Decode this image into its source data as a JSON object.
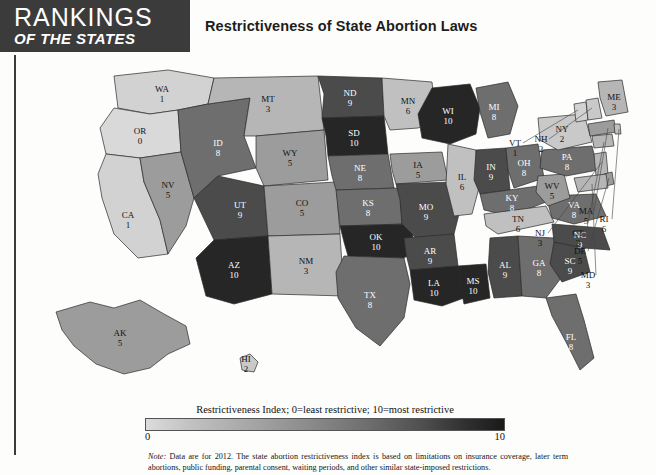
{
  "brand": {
    "line1": "RANKINGS",
    "line2": "OF THE STATES"
  },
  "title": "Restrictiveness of State Abortion Laws",
  "legend": {
    "caption": "Restrictiveness Index; 0=least restrictive; 10=most restrictive",
    "min": "0",
    "max": "10",
    "gradient_from": "#dcdcdc",
    "gradient_to": "#1a1a1a"
  },
  "note": {
    "label": "Note:",
    "line1": "Data are for 2012. The state abortion restrictiveness index is based on limitations on insurance coverage, later term",
    "line2": "abortions, public funding, parental consent, waiting periods, and other similar state-imposed restrictions."
  },
  "chart_data": {
    "type": "choropleth",
    "title": "Restrictiveness of State Abortion Laws",
    "value_name": "Restrictiveness Index",
    "vmin": 0,
    "vmax": 10,
    "colormap": "grayscale-light-to-dark",
    "year": "2012",
    "states": [
      {
        "code": "WA",
        "value": 1
      },
      {
        "code": "OR",
        "value": 0
      },
      {
        "code": "CA",
        "value": 1
      },
      {
        "code": "NV",
        "value": 5
      },
      {
        "code": "ID",
        "value": 8
      },
      {
        "code": "MT",
        "value": 3
      },
      {
        "code": "WY",
        "value": 5
      },
      {
        "code": "UT",
        "value": 9
      },
      {
        "code": "CO",
        "value": 5
      },
      {
        "code": "AZ",
        "value": 10
      },
      {
        "code": "NM",
        "value": 3
      },
      {
        "code": "ND",
        "value": 9
      },
      {
        "code": "SD",
        "value": 10
      },
      {
        "code": "NE",
        "value": 8
      },
      {
        "code": "KS",
        "value": 8
      },
      {
        "code": "OK",
        "value": 10
      },
      {
        "code": "TX",
        "value": 8
      },
      {
        "code": "MN",
        "value": 6
      },
      {
        "code": "IA",
        "value": 5
      },
      {
        "code": "MO",
        "value": 9
      },
      {
        "code": "AR",
        "value": 9
      },
      {
        "code": "LA",
        "value": 10
      },
      {
        "code": "WI",
        "value": 10
      },
      {
        "code": "IL",
        "value": 6
      },
      {
        "code": "MS",
        "value": 10
      },
      {
        "code": "MI",
        "value": 8
      },
      {
        "code": "IN",
        "value": 9
      },
      {
        "code": "KY",
        "value": 8
      },
      {
        "code": "TN",
        "value": 6
      },
      {
        "code": "AL",
        "value": 9
      },
      {
        "code": "OH",
        "value": 8
      },
      {
        "code": "GA",
        "value": 8
      },
      {
        "code": "FL",
        "value": 8
      },
      {
        "code": "SC",
        "value": 9
      },
      {
        "code": "NC",
        "value": 9
      },
      {
        "code": "VA",
        "value": 8
      },
      {
        "code": "WV",
        "value": 5
      },
      {
        "code": "PA",
        "value": 8
      },
      {
        "code": "NY",
        "value": 2
      },
      {
        "code": "VT",
        "value": 1
      },
      {
        "code": "NH",
        "value": 2
      },
      {
        "code": "ME",
        "value": 3
      },
      {
        "code": "MA",
        "value": 5
      },
      {
        "code": "RI",
        "value": 6
      },
      {
        "code": "CT",
        "value": 3
      },
      {
        "code": "NJ",
        "value": 3
      },
      {
        "code": "DE",
        "value": 5
      },
      {
        "code": "MD",
        "value": 3
      },
      {
        "code": "AK",
        "value": 5
      },
      {
        "code": "HI",
        "value": 2
      }
    ]
  }
}
